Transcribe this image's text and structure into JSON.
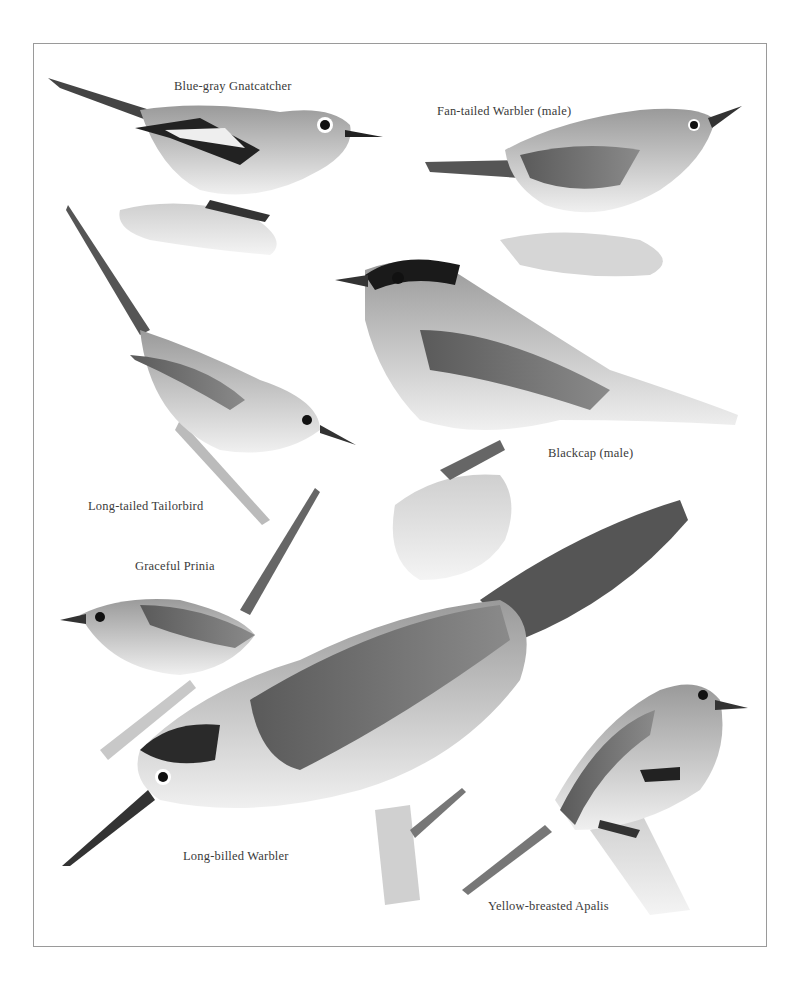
{
  "plate": {
    "style": "grayscale natural-history illustration plate",
    "border_color": "#9a9a9a",
    "birds": [
      {
        "name": "Blue-gray Gnatcatcher",
        "label_pos": [
          174,
          80
        ]
      },
      {
        "name": "Fan-tailed Warbler (male)",
        "label_pos": [
          437,
          105
        ]
      },
      {
        "name": "Blackcap (male)",
        "label_pos": [
          548,
          447
        ]
      },
      {
        "name": "Long-tailed Tailorbird",
        "label_pos": [
          88,
          500
        ]
      },
      {
        "name": "Graceful Prinia",
        "label_pos": [
          135,
          560
        ]
      },
      {
        "name": "Long-billed Warbler",
        "label_pos": [
          183,
          850
        ]
      },
      {
        "name": "Yellow-breasted Apalis",
        "label_pos": [
          488,
          900
        ]
      }
    ]
  }
}
